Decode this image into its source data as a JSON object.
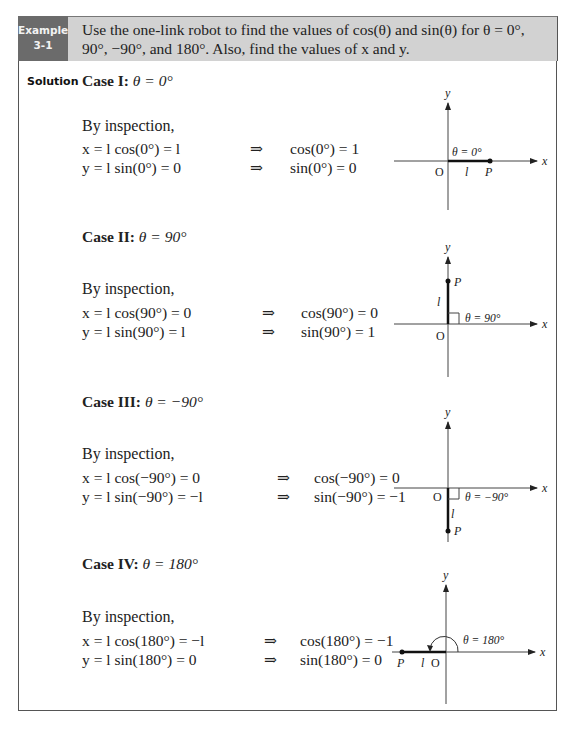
{
  "example": {
    "label_line1": "Example",
    "label_line2": "3-1",
    "prompt": "Use the one-link robot to find the values of cos(θ) and sin(θ) for θ = 0°,  90°,  −90°, and 180°. Also, find the values of x and y."
  },
  "solution_label": "Solution",
  "cases": [
    {
      "title_bold": "Case I:",
      "title_eq": "θ = 0°",
      "inspection": "By inspection,",
      "eq_x_lhs": "x = l cos(0°) = l",
      "eq_x_rhs": "cos(0°) = 1",
      "eq_y_lhs": "y = l sin(0°) = 0",
      "eq_y_rhs": "sin(0°) = 0",
      "diagram": {
        "theta_label": "θ = 0°",
        "origin": "O",
        "point": "P",
        "link": "l",
        "x_axis": "x",
        "y_axis": "y"
      }
    },
    {
      "title_bold": "Case II:",
      "title_eq": "θ = 90°",
      "inspection": "By inspection,",
      "eq_x_lhs": "x = l cos(90°) = 0",
      "eq_x_rhs": "cos(90°) = 0",
      "eq_y_lhs": "y = l sin(90°) = l",
      "eq_y_rhs": "sin(90°) = 1",
      "diagram": {
        "theta_label": "θ = 90°",
        "origin": "O",
        "point": "P",
        "link": "l",
        "x_axis": "x",
        "y_axis": "y"
      }
    },
    {
      "title_bold": "Case III:",
      "title_eq": "θ = −90°",
      "inspection": "By inspection,",
      "eq_x_lhs": "x = l cos(−90°) = 0",
      "eq_x_rhs": "cos(−90°) = 0",
      "eq_y_lhs": "y = l sin(−90°) = −l",
      "eq_y_rhs": "sin(−90°) = −1",
      "diagram": {
        "theta_label": "θ = −90°",
        "origin": "O",
        "point": "P",
        "link": "l",
        "x_axis": "x",
        "y_axis": "y"
      }
    },
    {
      "title_bold": "Case IV:",
      "title_eq": "θ = 180°",
      "inspection": "By inspection,",
      "eq_x_lhs": "x = l cos(180°) = −l",
      "eq_x_rhs": "cos(180°) = −1",
      "eq_y_lhs": "y = l sin(180°) = 0",
      "eq_y_rhs": "sin(180°) = 0",
      "diagram": {
        "theta_label": "θ = 180°",
        "origin": "O",
        "point": "P",
        "link": "l",
        "x_axis": "x",
        "y_axis": "y"
      }
    }
  ],
  "implies_symbol": "⇒"
}
